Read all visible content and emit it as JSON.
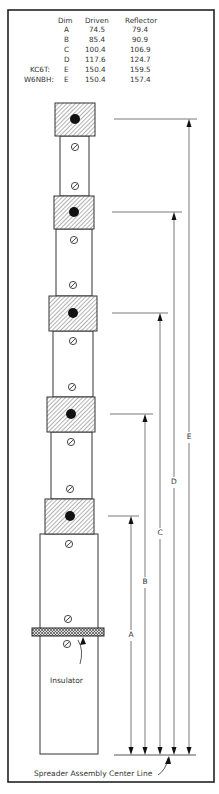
{
  "table": {
    "headers": {
      "dim": "Dim",
      "driven": "Driven",
      "reflector": "Reflector"
    },
    "rows": [
      {
        "prefix": "",
        "dim": "A",
        "driven": "74.5",
        "reflector": "79.4"
      },
      {
        "prefix": "",
        "dim": "B",
        "driven": "85.4",
        "reflector": "90.9"
      },
      {
        "prefix": "",
        "dim": "C",
        "driven": "100.4",
        "reflector": "106.9"
      },
      {
        "prefix": "",
        "dim": "D",
        "driven": "117.6",
        "reflector": "124.7"
      },
      {
        "prefix": "KC6T:",
        "dim": "E",
        "driven": "150.4",
        "reflector": "159.5"
      },
      {
        "prefix": "W6NBH:",
        "dim": "E",
        "driven": "150.4",
        "reflector": "157.4"
      }
    ]
  },
  "dimensions": [
    "A",
    "B",
    "C",
    "D",
    "E"
  ],
  "labels": {
    "insulator": "Insulator",
    "centerline": "Spreader Assembly Center Line"
  }
}
